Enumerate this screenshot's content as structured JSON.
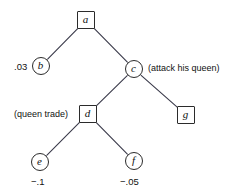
{
  "diagram": {
    "type": "game-tree",
    "title": "",
    "background_color": "#ffffff",
    "line_color": "#3a3a4a",
    "node_border_color": "#2b2b2b",
    "nodes": [
      {
        "id": "a",
        "label": "a",
        "shape": "square",
        "x": 86,
        "y": 20
      },
      {
        "id": "b",
        "label": "b",
        "shape": "circle",
        "x": 41,
        "y": 66
      },
      {
        "id": "c",
        "label": "c",
        "shape": "circle",
        "x": 134,
        "y": 69
      },
      {
        "id": "d",
        "label": "d",
        "shape": "square",
        "x": 88,
        "y": 114
      },
      {
        "id": "g",
        "label": "g",
        "shape": "square",
        "x": 186,
        "y": 115
      },
      {
        "id": "e",
        "label": "e",
        "shape": "circle",
        "x": 40,
        "y": 162
      },
      {
        "id": "f",
        "label": "f",
        "shape": "circle",
        "x": 134,
        "y": 161
      }
    ],
    "edges": [
      {
        "from": "a",
        "to": "b"
      },
      {
        "from": "a",
        "to": "c"
      },
      {
        "from": "c",
        "to": "d"
      },
      {
        "from": "c",
        "to": "g"
      },
      {
        "from": "d",
        "to": "e"
      },
      {
        "from": "d",
        "to": "f"
      }
    ],
    "annotations": [
      {
        "id": "b-value",
        "text": ".03",
        "for": "b",
        "x": 14,
        "y": 62,
        "kind": "value"
      },
      {
        "id": "c-note",
        "text": "(attack his queen)",
        "for": "c",
        "x": 148,
        "y": 64,
        "kind": "note"
      },
      {
        "id": "d-note",
        "text": "(queen trade)",
        "for": "d",
        "x": 14,
        "y": 110,
        "kind": "note"
      },
      {
        "id": "e-value",
        "text": "−.1",
        "for": "e",
        "x": 31,
        "y": 177,
        "kind": "value"
      },
      {
        "id": "f-value",
        "text": "−.05",
        "for": "f",
        "x": 120,
        "y": 177,
        "kind": "value"
      }
    ]
  }
}
